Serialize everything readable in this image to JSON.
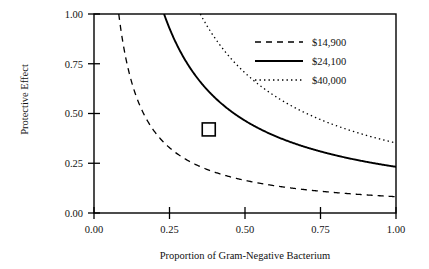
{
  "chart_data": {
    "type": "line",
    "title": "",
    "xlabel": "Proportion of Gram-Negative Bacterium",
    "ylabel": "Protective Effect",
    "xlim": [
      0.0,
      1.0
    ],
    "ylim": [
      0.0,
      1.0
    ],
    "xticks": [
      "0.00",
      "0.25",
      "0.50",
      "0.75",
      "1.00"
    ],
    "xtick_values": [
      0.0,
      0.25,
      0.5,
      0.75,
      1.0
    ],
    "yticks": [
      "0.00",
      "0.25",
      "0.50",
      "0.75",
      "1.00"
    ],
    "ytick_values": [
      0.0,
      0.25,
      0.5,
      0.75,
      1.0
    ],
    "grid": false,
    "legend_position": "top-right",
    "series": [
      {
        "name": "$14,900",
        "style": "dashed",
        "color": "#000000",
        "form": "hyperbola y = k/x",
        "k": 0.082,
        "x": [
          0.082,
          0.1,
          0.125,
          0.15,
          0.2,
          0.25,
          0.3,
          0.35,
          0.4,
          0.5,
          0.6,
          0.7,
          0.8,
          0.9,
          1.0
        ],
        "values": [
          1.0,
          0.82,
          0.656,
          0.547,
          0.41,
          0.328,
          0.273,
          0.234,
          0.205,
          0.164,
          0.137,
          0.117,
          0.1025,
          0.091,
          0.082
        ]
      },
      {
        "name": "$24,100",
        "style": "solid",
        "color": "#000000",
        "form": "hyperbola y = k/x",
        "k": 0.232,
        "x": [
          0.232,
          0.25,
          0.3,
          0.35,
          0.38,
          0.4,
          0.45,
          0.5,
          0.6,
          0.7,
          0.8,
          0.9,
          1.0
        ],
        "values": [
          1.0,
          0.928,
          0.773,
          0.663,
          0.611,
          0.58,
          0.516,
          0.464,
          0.387,
          0.331,
          0.29,
          0.258,
          0.232
        ]
      },
      {
        "name": "$40,000",
        "style": "dotted",
        "color": "#000000",
        "form": "hyperbola y = k/x",
        "k": 0.352,
        "x": [
          0.352,
          0.4,
          0.45,
          0.5,
          0.6,
          0.7,
          0.8,
          0.9,
          1.0
        ],
        "values": [
          1.0,
          0.88,
          0.782,
          0.704,
          0.587,
          0.503,
          0.44,
          0.391,
          0.352
        ]
      }
    ],
    "annotations": [
      {
        "name": "base-case-marker",
        "shape": "open-square",
        "x": 0.38,
        "y": 0.42,
        "label": ""
      }
    ]
  },
  "legend": {
    "entries": [
      {
        "label": "$14,900",
        "style": "dashed"
      },
      {
        "label": "$24,100",
        "style": "solid"
      },
      {
        "label": "$40,000",
        "style": "dotted"
      }
    ]
  },
  "footer": {
    "caption_fragment": ""
  }
}
